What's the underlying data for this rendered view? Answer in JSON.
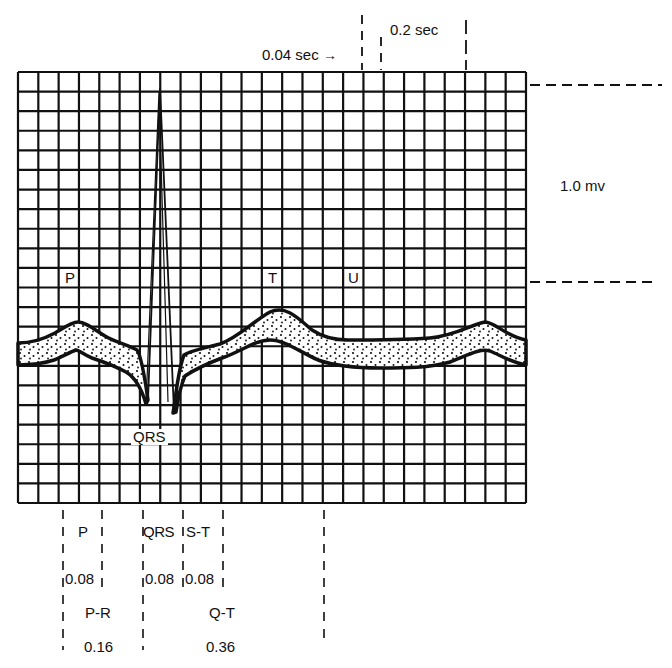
{
  "diagram": {
    "type": "ecg-waveform",
    "grid": {
      "columns": 25,
      "rows": 22,
      "left": 18,
      "top": 72,
      "right": 526,
      "bottom": 503,
      "line_color": "#111111"
    },
    "time_scale": {
      "small_box_label": "0.04 sec",
      "large_box_label": "0.2 sec",
      "arrow_glyph": "→"
    },
    "voltage_scale": {
      "label": "1.0 mv"
    },
    "wave_labels": {
      "p": "P",
      "qrs": "QRS",
      "t": "T",
      "u": "U"
    },
    "intervals": [
      {
        "name": "P",
        "duration": "0.08"
      },
      {
        "name": "QRS",
        "duration": "0.08"
      },
      {
        "name": "S-T",
        "duration": "0.08"
      },
      {
        "name": "P-R",
        "duration": "0.16"
      },
      {
        "name": "Q-T",
        "duration": "0.36"
      }
    ],
    "fill_style": "stippled",
    "trace_color": "#111111"
  }
}
